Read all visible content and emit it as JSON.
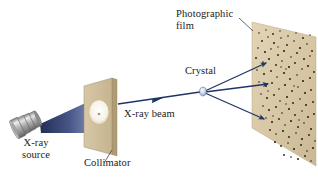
{
  "figure": {
    "background_color": "#ffffff"
  },
  "labels": {
    "photographic_film": "Photographic\nfilm",
    "crystal": "Crystal",
    "xray_beam": "X-ray beam",
    "xray_source": "X-ray\nsource",
    "collimator": "Collimator"
  },
  "colors": {
    "plate_tan": "#d3c2a0",
    "plate_tan_light": "#ddcdad",
    "plate_edge": "#9c8c6c",
    "beam_navy": "#1d2f63",
    "beam_light": "#8d9cc4",
    "ray_navy": "#1f3566",
    "tube_grey": "#9a9a9a",
    "tube_light": "#d8d8d8",
    "tube_dark": "#6e6e6e",
    "crystal_blue": "#b9c8e2",
    "dot_dark": "#241a10",
    "text": "#1a1a1a"
  },
  "components": {
    "xray_source": {
      "name": "X-ray source tube",
      "shape": "banded cylinder",
      "position": "lower-left"
    },
    "beam_cone": {
      "name": "Diverging X-ray beam cone",
      "from": "x-ray source",
      "to": "collimator aperture"
    },
    "collimator": {
      "name": "Collimator plate",
      "shape": "tilted rectangular plate with circular aperture",
      "aperture": "white ellipse with dark center"
    },
    "xray_beam": {
      "name": "Collimated X-ray beam",
      "arrowheads": 1,
      "from": "collimator",
      "to": "crystal"
    },
    "crystal": {
      "name": "Crystal sample",
      "shape": "small ellipse"
    },
    "diffracted_beams": {
      "name": "Diffracted X-ray beams",
      "count": 3,
      "arrowheads": 3,
      "from": "crystal",
      "to": "photographic film"
    },
    "photographic_film": {
      "name": "Photographic film",
      "shape": "tilted rectangular plate",
      "pattern": "Laue diffraction spot pattern",
      "spot_count": 240
    }
  }
}
